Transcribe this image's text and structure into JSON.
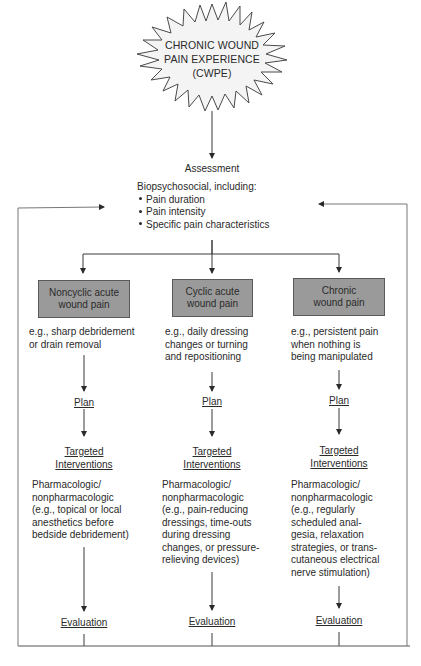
{
  "title_burst": {
    "lines": [
      "CHRONIC WOUND",
      "PAIN EXPERIENCE",
      "(CWPE)"
    ]
  },
  "assessment": {
    "label": "Assessment",
    "intro": "Biopsychosocial, including:",
    "bullets": [
      "Pain duration",
      "Pain intensity",
      "Specific pain characteristics"
    ]
  },
  "columns": [
    {
      "category": [
        "Noncyclic acute",
        "wound pain"
      ],
      "example": [
        "e.g., sharp debridement",
        "or drain removal"
      ],
      "plan": "Plan",
      "targeted": [
        "Targeted",
        "Interventions"
      ],
      "interventions": [
        "Pharmacologic/",
        "nonpharmacologic",
        "(e.g., topical or local",
        "anesthetics before",
        "bedside debridement)"
      ],
      "evaluation": "Evaluation"
    },
    {
      "category": [
        "Cyclic acute",
        "wound pain"
      ],
      "example": [
        "e.g., daily dressing",
        "changes or turning",
        "and repositioning"
      ],
      "plan": "Plan",
      "targeted": [
        "Targeted",
        "Interventions"
      ],
      "interventions": [
        "Pharmacologic/",
        "nonpharmacologic",
        "(e.g., pain-reducing",
        "dressings, time-outs",
        "during dressing",
        "changes, or pressure-",
        "relieving devices)"
      ],
      "evaluation": "Evaluation"
    },
    {
      "category": [
        "Chronic",
        "wound pain"
      ],
      "example": [
        "e.g., persistent pain",
        "when nothing is",
        "being manipulated"
      ],
      "plan": "Plan",
      "targeted": [
        "Targeted",
        "Interventions"
      ],
      "interventions": [
        "Pharmacologic/",
        "nonpharmacologic",
        "(e.g., regularly",
        "scheduled anal-",
        "gesia, relaxation",
        "strategies, or trans-",
        "cutaneous electrical",
        "nerve stimulation)"
      ],
      "evaluation": "Evaluation"
    }
  ],
  "colors": {
    "category_box_fill": "#9a9a9a",
    "line": "#3a3a3a",
    "frame": "#777777",
    "text": "#2a2a2a"
  }
}
